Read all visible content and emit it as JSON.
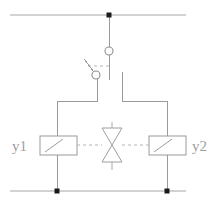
{
  "diagram": {
    "background_color": "#ffffff",
    "line_color": "#9a9a9a",
    "node_color": "#1a1a1a",
    "label_color": "#a0a0a0",
    "labels": {
      "left_coil": "y1",
      "right_coil": "y2"
    },
    "components": {
      "top_rail": {
        "name": "top supply rail",
        "y": 15,
        "x_start": 10,
        "x_end": 186
      },
      "bottom_rail": {
        "name": "bottom return rail",
        "y": 191,
        "x_start": 10,
        "x_end": 186
      },
      "junction_nodes": [
        {
          "name": "top junction",
          "x": 109,
          "y": 15
        },
        {
          "name": "bottom left junction",
          "x": 57,
          "y": 191
        },
        {
          "name": "bottom right junction",
          "x": 167,
          "y": 191
        }
      ],
      "switch": {
        "name": "changeover switch",
        "upper_terminal": {
          "x": 109,
          "y": 51,
          "r": 4
        },
        "lower_terminal": {
          "x": 96,
          "y": 75,
          "r": 4
        },
        "lever_from": {
          "x": 84,
          "y": 59
        },
        "lever_to": {
          "x": 94,
          "y": 72
        },
        "dashed_link_y": 66
      },
      "left_coil": {
        "name": "solenoid coil y1",
        "x": 40,
        "y": 136,
        "width": 37,
        "height": 19
      },
      "right_coil": {
        "name": "solenoid coil y2",
        "x": 149,
        "y": 136,
        "width": 37,
        "height": 19
      },
      "valve": {
        "name": "bowtie valve body",
        "center_x": 112,
        "center_y": 145,
        "half_width": 10,
        "half_height": 17,
        "stem_top_y": 122,
        "stem_bottom_y": 170
      },
      "dashed_actuation_line": {
        "name": "mechanical actuation link",
        "y": 145,
        "x_start": 77,
        "x_end": 149
      }
    }
  }
}
